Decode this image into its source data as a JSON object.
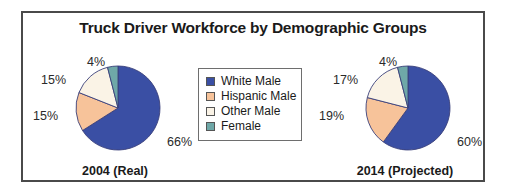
{
  "chart_data": {
    "type": "pie",
    "title": "Truck Driver Workforce by Demographic Groups",
    "categories": [
      "White Male",
      "Hispanic Male",
      "Other Male",
      "Female"
    ],
    "colors": [
      "#3a4fa4",
      "#f7c39a",
      "#faf3e6",
      "#6fa8a8"
    ],
    "legend_position": "center",
    "grid": false,
    "charts": [
      {
        "caption": "2004 (Real)",
        "values": [
          66,
          15,
          15,
          4
        ],
        "labels": [
          "66%",
          "15%",
          "15%",
          "4%"
        ]
      },
      {
        "caption": "2014 (Projected)",
        "values": [
          60,
          19,
          17,
          4
        ],
        "labels": [
          "60%",
          "19%",
          "17%",
          "4%"
        ]
      }
    ]
  },
  "legend": {
    "items": [
      {
        "label": "White Male",
        "color": "#3a4fa4"
      },
      {
        "label": "Hispanic Male",
        "color": "#f7c39a"
      },
      {
        "label": "Other Male",
        "color": "#faf3e6"
      },
      {
        "label": "Female",
        "color": "#6fa8a8"
      }
    ]
  }
}
